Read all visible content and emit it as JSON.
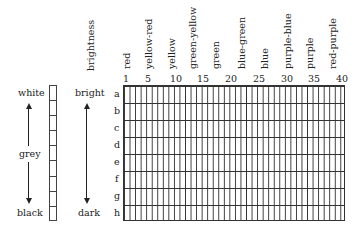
{
  "diagram": {
    "grey_scale": {
      "top_label": "white",
      "middle_label": "grey",
      "bottom_label": "black",
      "cells": 9
    },
    "brightness": {
      "axis_label": "brightness",
      "top_label": "bright",
      "bottom_label": "dark"
    },
    "hue_labels": [
      "red",
      "yellow-red",
      "yellow",
      "green-yellow",
      "green",
      "blue-green",
      "blue",
      "purple-blue",
      "purple",
      "red-purple"
    ],
    "column_numbers": [
      "1",
      "5",
      "10",
      "15",
      "20",
      "25",
      "30",
      "35",
      "40"
    ],
    "row_labels": [
      "a",
      "b",
      "c",
      "d",
      "e",
      "f",
      "g",
      "h"
    ],
    "columns": 40,
    "rows": 8
  }
}
